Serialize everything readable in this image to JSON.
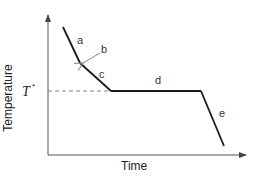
{
  "diagram": {
    "x_axis_label": "Time",
    "y_axis_label": "Temperature",
    "reference_level": {
      "label": "T",
      "superscript": "*",
      "style": "dashed"
    },
    "segments": [
      {
        "id": "a",
        "label": "a",
        "description": "steep cooling"
      },
      {
        "id": "b",
        "label": "b",
        "description": "kink point (arrow)"
      },
      {
        "id": "c",
        "label": "c",
        "description": "slower cooling"
      },
      {
        "id": "d",
        "label": "d",
        "description": "plateau at T*"
      },
      {
        "id": "e",
        "label": "e",
        "description": "final cooling"
      }
    ],
    "colors": {
      "line": "#1a1a1a",
      "axis": "#555555",
      "dashed": "#777777",
      "arrow": "#888888"
    }
  }
}
